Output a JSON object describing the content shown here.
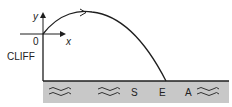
{
  "diagram": {
    "cliff_label": "CLIFF",
    "sea_label_letters": [
      "S",
      "E",
      "A"
    ],
    "axes": {
      "x_label": "x",
      "y_label": "y",
      "origin_label": "0"
    },
    "colors": {
      "sea_fill": "#c8c8c8",
      "line": "#1e1e1e",
      "background": "#ffffff"
    }
  }
}
